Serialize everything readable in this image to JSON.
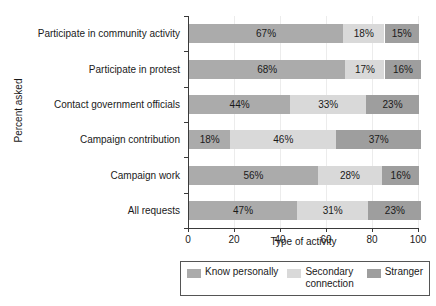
{
  "chart_data": {
    "type": "bar",
    "orientation": "horizontal",
    "stacked": true,
    "title": "",
    "xlabel": "Type of activity",
    "ylabel": "Percent asked",
    "xlim": [
      0,
      100
    ],
    "xticks": [
      0,
      20,
      40,
      60,
      80,
      100
    ],
    "xticklabels": [
      "0",
      "20",
      "40",
      "60",
      "80",
      "100"
    ],
    "grid": "vertical",
    "legend_position": "bottom",
    "categories": [
      "Participate in community activity",
      "Participate in protest",
      "Contact government officials",
      "Campaign contribution",
      "Campaign work",
      "All requests"
    ],
    "series": [
      {
        "name": "Know personally",
        "color": "#ababab",
        "values": [
          67,
          68,
          44,
          18,
          56,
          47
        ],
        "labels": [
          "67%",
          "68%",
          "44%",
          "18%",
          "56%",
          "47%"
        ]
      },
      {
        "name": "Secondary connection",
        "color": "#d9d9d9",
        "values": [
          18,
          17,
          33,
          46,
          28,
          31
        ],
        "labels": [
          "18%",
          "17%",
          "33%",
          "46%",
          "28%",
          "31%"
        ]
      },
      {
        "name": "Stranger",
        "color": "#9e9e9e",
        "values": [
          15,
          16,
          23,
          37,
          16,
          23
        ],
        "labels": [
          "15%",
          "16%",
          "23%",
          "37%",
          "16%",
          "23%"
        ]
      }
    ]
  },
  "legend": {
    "items": [
      {
        "label": "Know personally",
        "color": "#ababab"
      },
      {
        "label": "Secondary connection",
        "color": "#d9d9d9"
      },
      {
        "label": "Stranger",
        "color": "#9e9e9e"
      }
    ]
  }
}
